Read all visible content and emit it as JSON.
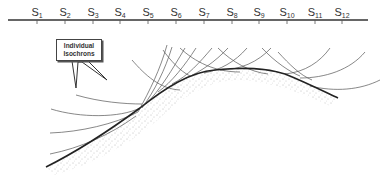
{
  "diagram": {
    "type": "seismic-isochron-migration",
    "surface_line": {
      "x1": 8,
      "x2": 368,
      "y": 20,
      "color": "#333333"
    },
    "stations": [
      {
        "label": "S",
        "sub": "1",
        "x": 37
      },
      {
        "label": "S",
        "sub": "2",
        "x": 65
      },
      {
        "label": "S",
        "sub": "3",
        "x": 93
      },
      {
        "label": "S",
        "sub": "4",
        "x": 120
      },
      {
        "label": "S",
        "sub": "5",
        "x": 148
      },
      {
        "label": "S",
        "sub": "6",
        "x": 176
      },
      {
        "label": "S",
        "sub": "7",
        "x": 204
      },
      {
        "label": "S",
        "sub": "8",
        "x": 232
      },
      {
        "label": "S",
        "sub": "9",
        "x": 259
      },
      {
        "label": "S",
        "sub": "10",
        "x": 287
      },
      {
        "label": "S",
        "sub": "11",
        "x": 315
      },
      {
        "label": "S",
        "sub": "12",
        "x": 342
      }
    ],
    "callout": {
      "line1": "Individual",
      "line2": "Isochrons"
    },
    "reflector": {
      "description": "Anticline-shaped reflector with stippled lower side",
      "color": "#222222"
    },
    "colors": {
      "line": "#444444",
      "reflector": "#222222",
      "stipple": "#888888"
    }
  }
}
